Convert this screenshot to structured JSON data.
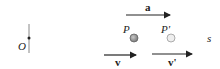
{
  "diagram": {
    "origin_label": "O",
    "axis_label": "s",
    "point_p_label": "P",
    "point_p_prime_label": "P'",
    "acceleration_label": "a",
    "velocity_label": "v",
    "velocity_prime_label": "v'"
  },
  "colors": {
    "axis": "#555555",
    "point_p": "#9a9a9a",
    "point_p_prime": "#e6e6e6",
    "arrow": "#222222"
  }
}
